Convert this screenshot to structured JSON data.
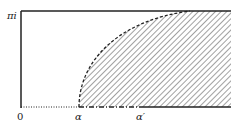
{
  "diagram": {
    "type": "conformal-strip",
    "labels": {
      "top_left": "πi",
      "origin": "0",
      "alpha": "α",
      "alpha_prime": "α′"
    },
    "colors": {
      "line": "#222222",
      "hatch": "#444444",
      "background": "#ffffff"
    },
    "regions": [
      {
        "name": "hatched-region",
        "description": "region right of dashed curve from α to top edge"
      }
    ],
    "boundaries": [
      {
        "name": "top-edge",
        "style": "solid"
      },
      {
        "name": "left-edge",
        "style": "solid"
      },
      {
        "name": "bottom-0-to-alpha",
        "style": "dotted"
      },
      {
        "name": "bottom-alpha-to-alpha-prime",
        "style": "dash-dot"
      },
      {
        "name": "bottom-beyond-alpha-prime",
        "style": "solid"
      },
      {
        "name": "curve",
        "style": "dashed"
      }
    ]
  }
}
